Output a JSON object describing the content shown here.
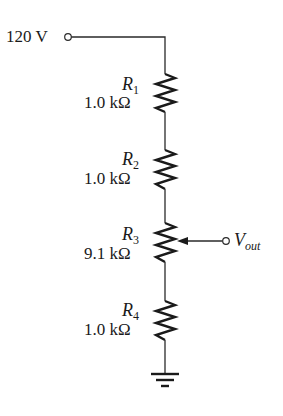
{
  "diagram": {
    "type": "voltage-divider-circuit",
    "source": {
      "label": "120 V",
      "value": 120,
      "unit": "V"
    },
    "resistors": [
      {
        "name": "R",
        "index": "1",
        "value_label": "1.0 kΩ",
        "value": 1.0,
        "unit": "kΩ",
        "variable": false
      },
      {
        "name": "R",
        "index": "2",
        "value_label": "1.0 kΩ",
        "value": 1.0,
        "unit": "kΩ",
        "variable": false
      },
      {
        "name": "R",
        "index": "3",
        "value_label": "9.1 kΩ",
        "value": 9.1,
        "unit": "kΩ",
        "variable": true
      },
      {
        "name": "R",
        "index": "4",
        "value_label": "1.0 kΩ",
        "value": 1.0,
        "unit": "kΩ",
        "variable": false
      }
    ],
    "output": {
      "name": "V",
      "subscript": "out",
      "attached_to": "R3 wiper"
    },
    "ground": {
      "symbol": "ground-icon"
    },
    "colors": {
      "wire": "#2a2a2a",
      "ink": "#1a1a1a",
      "background": "#ffffff"
    }
  }
}
